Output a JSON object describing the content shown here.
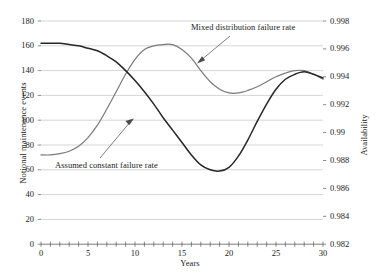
{
  "chart_data": {
    "type": "line",
    "title": "",
    "xlabel": "Years",
    "ylabel": "Notional maintenance events",
    "y2label": "Availability",
    "xlim": [
      0,
      30
    ],
    "ylim": [
      0,
      180
    ],
    "y2lim": [
      0.982,
      0.998
    ],
    "grid": "horizontal",
    "legend_position": "inline-annotations",
    "xticks": [
      0,
      5,
      10,
      15,
      20,
      25,
      30
    ],
    "xtick_labels": [
      "0",
      "5",
      "10",
      "15",
      "20",
      "25",
      "30"
    ],
    "x_minor_tick_interval": 1,
    "yticks": [
      0,
      20,
      40,
      60,
      80,
      100,
      120,
      140,
      160,
      180
    ],
    "ytick_labels": [
      "0",
      "20",
      "40",
      "60",
      "80",
      "100",
      "120",
      "140",
      "160",
      "180"
    ],
    "y2ticks": [
      0.982,
      0.984,
      0.986,
      0.988,
      0.99,
      0.992,
      0.994,
      0.996,
      0.998
    ],
    "y2tick_labels": [
      "0.982",
      "0.984",
      "0.986",
      "0.988",
      "0.99",
      "0.992",
      "0.994",
      "0.996",
      "0.998"
    ],
    "x": [
      0,
      1,
      2,
      3,
      4,
      5,
      6,
      7,
      8,
      9,
      10,
      11,
      12,
      13,
      14,
      15,
      16,
      17,
      18,
      19,
      20,
      21,
      22,
      23,
      24,
      25,
      26,
      27,
      28,
      29,
      30
    ],
    "series": [
      {
        "name": "Assumed constant failure rate",
        "color": "#262626",
        "width": 1.5,
        "values": [
          162,
          162,
          162,
          161,
          160,
          158,
          156,
          152,
          147,
          140,
          132,
          123,
          113,
          102,
          92,
          82,
          72,
          64,
          60,
          59,
          62,
          71,
          84,
          99,
          113,
          125,
          133,
          137,
          139,
          137,
          134
        ]
      },
      {
        "name": "Mixed distribution failure rate",
        "color": "#7a7a7a",
        "width": 1.2,
        "values": [
          72,
          72,
          73,
          75,
          79,
          86,
          96,
          109,
          123,
          137,
          149,
          157,
          160,
          161,
          161,
          157,
          150,
          140,
          131,
          125,
          122,
          122,
          124,
          127,
          131,
          135,
          138,
          140,
          140,
          137,
          133
        ]
      }
    ],
    "annotations": [
      {
        "text": "Mixed distribution failure rate",
        "target_x": 16.5,
        "target_y": 146
      },
      {
        "text": "Assumed constant failure rate",
        "target_x": 10.8,
        "target_y": 105
      }
    ]
  }
}
